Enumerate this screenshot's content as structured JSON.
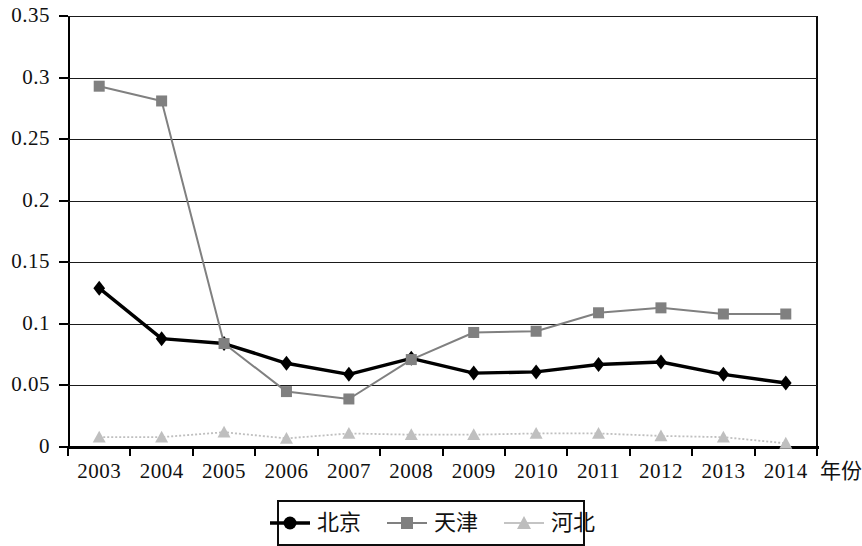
{
  "chart_data": {
    "type": "line",
    "title": "",
    "xlabel": "年份",
    "ylabel": "",
    "categories": [
      "2003",
      "2004",
      "2005",
      "2006",
      "2007",
      "2008",
      "2009",
      "2010",
      "2011",
      "2012",
      "2013",
      "2014"
    ],
    "ylim": [
      0,
      0.35
    ],
    "ytick_labels": [
      "0.35",
      "0.3",
      "0.25",
      "0.2",
      "0.15",
      "0.1",
      "0.05",
      "0"
    ],
    "ytick_values": [
      0.35,
      0.3,
      0.25,
      0.2,
      0.15,
      0.1,
      0.05,
      0
    ],
    "grid": true,
    "legend_position": "bottom",
    "series": [
      {
        "name": "北京",
        "color": "#000000",
        "marker": "diamond",
        "values": [
          0.129,
          0.088,
          0.084,
          0.068,
          0.059,
          0.072,
          0.06,
          0.061,
          0.067,
          0.069,
          0.059,
          0.052
        ]
      },
      {
        "name": "天津",
        "color": "#808080",
        "marker": "square",
        "values": [
          0.293,
          0.281,
          0.084,
          0.045,
          0.039,
          0.071,
          0.093,
          0.094,
          0.109,
          0.113,
          0.108,
          0.108
        ]
      },
      {
        "name": "河北",
        "color": "#bfbfbf",
        "marker": "triangle",
        "values": [
          0.008,
          0.008,
          0.012,
          0.007,
          0.011,
          0.01,
          0.01,
          0.011,
          0.011,
          0.009,
          0.008,
          0.003
        ]
      }
    ]
  },
  "legend": {
    "items": [
      {
        "label": "北京"
      },
      {
        "label": "天津"
      },
      {
        "label": "河北"
      }
    ]
  }
}
